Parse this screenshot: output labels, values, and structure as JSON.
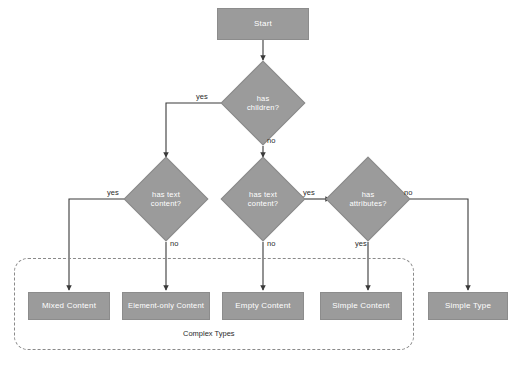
{
  "diagram": {
    "background_color": "#ffffff",
    "node_fill_color": "#9b9b9b",
    "node_text_color": "#ffffff",
    "edge_color": "#3a3a3a",
    "group_border_color": "#8a8a8a"
  },
  "nodes": {
    "start": {
      "label": "Start",
      "type": "terminator"
    },
    "has_children": {
      "label_line1": "has",
      "label_line2": "children?",
      "type": "decision"
    },
    "has_text_content_left": {
      "label_line1": "has text",
      "label_line2": "content?",
      "type": "decision"
    },
    "has_text_content_right": {
      "label_line1": "has text",
      "label_line2": "content?",
      "type": "decision"
    },
    "has_attributes": {
      "label_line1": "has",
      "label_line2": "attributes?",
      "type": "decision"
    },
    "mixed_content": {
      "label": "Mixed Content",
      "type": "result"
    },
    "element_only_content": {
      "label": "Element-only Content",
      "type": "result"
    },
    "empty_content": {
      "label": "Empty Content",
      "type": "result"
    },
    "simple_content": {
      "label": "Simple Content",
      "type": "result"
    },
    "simple_type": {
      "label": "Simple Type",
      "type": "result"
    }
  },
  "edge_labels": {
    "has_children_yes": "yes",
    "has_children_no": "no",
    "left_text_yes": "yes",
    "left_text_no": "no",
    "right_text_yes": "yes",
    "right_text_no": "no",
    "has_attributes_no": "no",
    "has_attributes_yes": "yes"
  },
  "group": {
    "label": "Complex Types"
  }
}
